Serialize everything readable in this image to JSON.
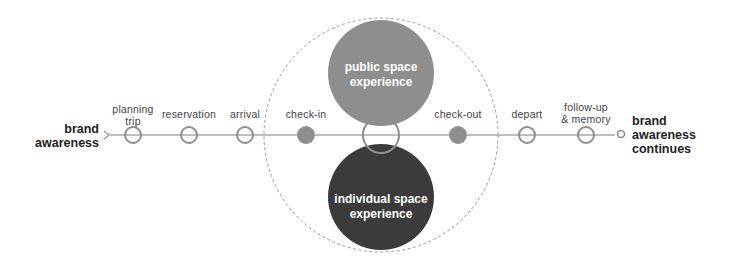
{
  "diagram": {
    "start_label": "brand\nawareness",
    "end_label": "brand\nawareness\ncontinues",
    "stages": [
      {
        "label": "planning\ntrip",
        "type": "open"
      },
      {
        "label": "reservation",
        "type": "open"
      },
      {
        "label": "arrival",
        "type": "open"
      },
      {
        "label": "check-in",
        "type": "filled"
      },
      {
        "label": "",
        "type": "center-open"
      },
      {
        "label": "check-out",
        "type": "filled"
      },
      {
        "label": "depart",
        "type": "open"
      },
      {
        "label": "follow-up\n& memory",
        "type": "open"
      }
    ],
    "public_circle": {
      "label": "public space\nexperience",
      "color": "#8e8e8e"
    },
    "individual_circle": {
      "label": "individual space\nexperience",
      "color": "#3b3b3b"
    },
    "colors": {
      "line": "#a8a8a8",
      "node_stroke": "#8e8e8e",
      "node_filled": "#8e8e8e",
      "dashed": "#9a9a9a"
    }
  }
}
